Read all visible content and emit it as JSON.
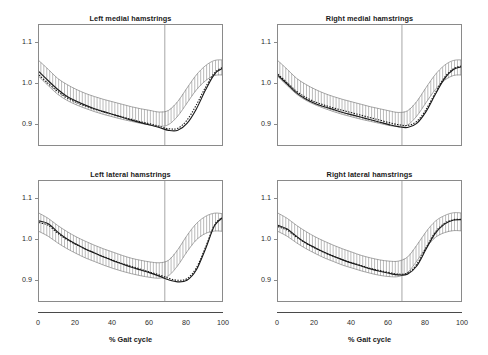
{
  "figure": {
    "width": 488,
    "height": 355,
    "background": "#ffffff",
    "axis_color": "#8a8a8a",
    "curve_color": "#1a1a1a",
    "band_color": "#808080"
  },
  "axes": {
    "x_title": "% Gait cycle",
    "x_ticks": [
      "0",
      "20",
      "40",
      "60",
      "80",
      "100"
    ],
    "x_tick_values": [
      0,
      20,
      40,
      60,
      80,
      100
    ],
    "y_ticks": [
      "0.9",
      "1.0",
      "1.1"
    ],
    "y_tick_values": [
      0.9,
      1.0,
      1.1
    ],
    "xlim": [
      0,
      100
    ],
    "ylim": [
      0.845,
      1.145
    ],
    "grid": false,
    "legend": "none"
  },
  "chart_data": {
    "type": "line",
    "xlabel": "% Gait cycle",
    "ylabel": "",
    "xlim": [
      0,
      100
    ],
    "ylim": [
      0.845,
      1.145
    ],
    "x": [
      0,
      5,
      10,
      15,
      20,
      25,
      30,
      35,
      40,
      45,
      50,
      55,
      60,
      65,
      70,
      75,
      80,
      85,
      90,
      95,
      100
    ],
    "panels": [
      {
        "title": "Left medial hamstrings",
        "toe_off": 68,
        "series": [
          {
            "name": "Band upper",
            "style": "solid-thin",
            "values": [
              1.057,
              1.036,
              1.014,
              0.999,
              0.987,
              0.977,
              0.969,
              0.962,
              0.956,
              0.95,
              0.944,
              0.939,
              0.935,
              0.931,
              0.935,
              0.957,
              0.99,
              1.022,
              1.045,
              1.058,
              1.059
            ]
          },
          {
            "name": "Band lower",
            "style": "solid-thin",
            "values": [
              1.018,
              0.996,
              0.975,
              0.96,
              0.949,
              0.94,
              0.932,
              0.925,
              0.919,
              0.913,
              0.908,
              0.903,
              0.899,
              0.896,
              0.9,
              0.921,
              0.953,
              0.985,
              1.008,
              1.021,
              1.022
            ]
          },
          {
            "name": "Mean (solid)",
            "style": "solid-thick",
            "values": [
              1.03,
              1.008,
              0.987,
              0.97,
              0.958,
              0.948,
              0.939,
              0.932,
              0.925,
              0.918,
              0.911,
              0.905,
              0.899,
              0.893,
              0.886,
              0.886,
              0.903,
              0.938,
              0.985,
              1.025,
              1.04
            ]
          },
          {
            "name": "Reference (dotted)",
            "style": "dotted",
            "values": [
              1.022,
              1.001,
              0.982,
              0.966,
              0.955,
              0.946,
              0.938,
              0.931,
              0.925,
              0.919,
              0.913,
              0.907,
              0.902,
              0.896,
              0.89,
              0.891,
              0.911,
              0.948,
              0.992,
              1.028,
              1.042
            ]
          }
        ]
      },
      {
        "title": "Right medial hamstrings",
        "toe_off": 67,
        "series": [
          {
            "name": "Band upper",
            "style": "solid-thin",
            "values": [
              1.057,
              1.036,
              1.014,
              0.999,
              0.987,
              0.977,
              0.969,
              0.962,
              0.956,
              0.95,
              0.944,
              0.939,
              0.934,
              0.93,
              0.934,
              0.957,
              0.991,
              1.023,
              1.046,
              1.058,
              1.059
            ]
          },
          {
            "name": "Band lower",
            "style": "solid-thin",
            "values": [
              1.018,
              0.996,
              0.975,
              0.96,
              0.949,
              0.94,
              0.932,
              0.925,
              0.919,
              0.913,
              0.908,
              0.903,
              0.898,
              0.895,
              0.899,
              0.921,
              0.954,
              0.986,
              1.009,
              1.021,
              1.022
            ]
          },
          {
            "name": "Mean (solid)",
            "style": "solid-thick",
            "values": [
              1.021,
              1.0,
              0.978,
              0.963,
              0.952,
              0.944,
              0.937,
              0.93,
              0.924,
              0.918,
              0.912,
              0.906,
              0.9,
              0.895,
              0.893,
              0.903,
              0.932,
              0.974,
              1.013,
              1.036,
              1.043
            ]
          },
          {
            "name": "Reference (dotted)",
            "style": "dotted",
            "values": [
              1.024,
              1.003,
              0.982,
              0.967,
              0.956,
              0.948,
              0.941,
              0.935,
              0.929,
              0.923,
              0.917,
              0.911,
              0.905,
              0.9,
              0.898,
              0.908,
              0.937,
              0.978,
              1.016,
              1.038,
              1.045
            ]
          }
        ]
      },
      {
        "title": "Left lateral hamstrings",
        "toe_off": 68,
        "series": [
          {
            "name": "Band upper",
            "style": "solid-thin",
            "values": [
              1.066,
              1.053,
              1.036,
              1.021,
              1.008,
              0.997,
              0.987,
              0.978,
              0.97,
              0.962,
              0.955,
              0.95,
              0.946,
              0.944,
              0.95,
              0.976,
              1.011,
              1.04,
              1.058,
              1.066,
              1.064
            ]
          },
          {
            "name": "Band lower",
            "style": "solid-thin",
            "values": [
              1.021,
              1.009,
              0.993,
              0.979,
              0.967,
              0.956,
              0.947,
              0.938,
              0.93,
              0.923,
              0.917,
              0.912,
              0.908,
              0.906,
              0.912,
              0.937,
              0.971,
              1.0,
              1.016,
              1.022,
              1.021
            ]
          },
          {
            "name": "Mean (solid)",
            "style": "solid-thick",
            "values": [
              1.047,
              1.04,
              1.02,
              1.003,
              0.99,
              0.978,
              0.968,
              0.958,
              0.949,
              0.941,
              0.933,
              0.926,
              0.919,
              0.911,
              0.902,
              0.897,
              0.901,
              0.926,
              0.978,
              1.036,
              1.057
            ]
          },
          {
            "name": "Reference (dotted)",
            "style": "dotted",
            "values": [
              1.043,
              1.036,
              1.017,
              1.001,
              0.989,
              0.978,
              0.968,
              0.959,
              0.95,
              0.942,
              0.935,
              0.928,
              0.921,
              0.914,
              0.906,
              0.901,
              0.905,
              0.931,
              0.982,
              1.038,
              1.058
            ]
          }
        ]
      },
      {
        "title": "Right lateral hamstrings",
        "toe_off": 67,
        "series": [
          {
            "name": "Band upper",
            "style": "solid-thin",
            "values": [
              1.066,
              1.053,
              1.036,
              1.021,
              1.008,
              0.997,
              0.987,
              0.978,
              0.97,
              0.962,
              0.956,
              0.951,
              0.948,
              0.948,
              0.958,
              0.987,
              1.02,
              1.046,
              1.06,
              1.067,
              1.066
            ]
          },
          {
            "name": "Band lower",
            "style": "solid-thin",
            "values": [
              1.021,
              1.009,
              0.993,
              0.979,
              0.967,
              0.956,
              0.947,
              0.938,
              0.931,
              0.924,
              0.918,
              0.913,
              0.91,
              0.91,
              0.92,
              0.948,
              0.981,
              1.006,
              1.018,
              1.023,
              1.022
            ]
          },
          {
            "name": "Mean (solid)",
            "style": "solid-thick",
            "values": [
              1.036,
              1.027,
              1.009,
              0.993,
              0.981,
              0.97,
              0.96,
              0.951,
              0.943,
              0.936,
              0.929,
              0.923,
              0.918,
              0.914,
              0.916,
              0.936,
              0.977,
              1.016,
              1.039,
              1.049,
              1.05
            ]
          },
          {
            "name": "Reference (dotted)",
            "style": "dotted",
            "values": [
              1.033,
              1.024,
              1.007,
              0.992,
              0.98,
              0.969,
              0.96,
              0.951,
              0.944,
              0.937,
              0.93,
              0.925,
              0.92,
              0.916,
              0.919,
              0.94,
              0.981,
              1.019,
              1.041,
              1.05,
              1.051
            ]
          }
        ]
      }
    ]
  }
}
